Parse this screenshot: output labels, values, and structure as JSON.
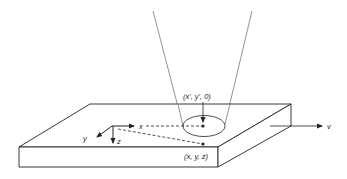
{
  "diagram": {
    "type": "schematic",
    "labels": {
      "surface_point": "(x', y', 0)",
      "subsurface_point": "(x, y, z)",
      "axis_x": "x",
      "axis_y": "y",
      "axis_z": "z",
      "velocity": "v"
    },
    "colors": {
      "stroke": "#222222",
      "cone": "#777777",
      "background": "#ffffff"
    },
    "elements": [
      "beam-cone",
      "beam-spot-ellipse",
      "slab",
      "coordinate-axes",
      "surface-point",
      "subsurface-point",
      "velocity-arrow"
    ]
  }
}
